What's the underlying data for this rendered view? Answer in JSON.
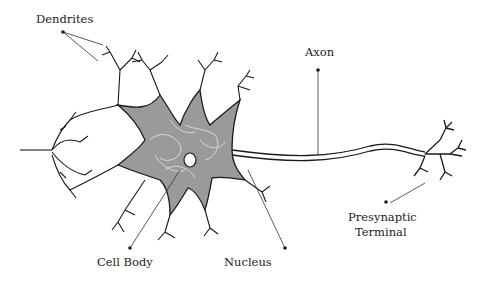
{
  "diagram": {
    "type": "neuron-anatomy",
    "labels": {
      "dendrites": "Dendrites",
      "axon": "Axon",
      "cell_body": "Cell Body",
      "nucleus": "Nucleus",
      "presynaptic_terminal_line1": "Presynaptic",
      "presynaptic_terminal_line2": "Terminal"
    },
    "colors": {
      "line": "#1a1a1a",
      "soma_fill": "#9a9a9a",
      "soma_texture": "#e8e8e8",
      "background": "#ffffff",
      "leader_line": "#333333"
    }
  }
}
